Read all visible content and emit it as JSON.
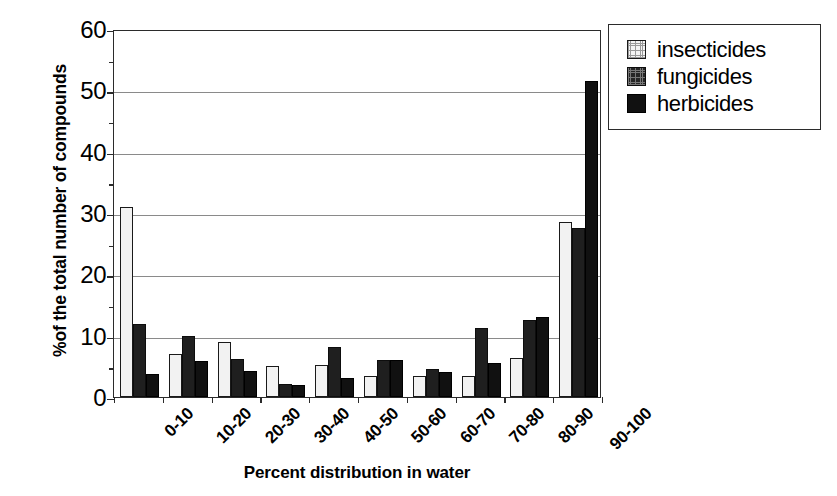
{
  "chart_data": {
    "type": "bar",
    "title": "",
    "xlabel": "Percent distribution in water",
    "ylabel": "%of the total number of compounds",
    "categories": [
      "0-10",
      "10-20",
      "20-30",
      "30-40",
      "40-50",
      "50-60",
      "60-70",
      "70-80",
      "80-90",
      "90-100"
    ],
    "series": [
      {
        "name": "insecticides",
        "swatch": "light-dotted",
        "values": [
          31,
          7,
          9,
          5,
          5.2,
          3.4,
          3.4,
          3.4,
          6.3,
          28.5
        ]
      },
      {
        "name": "fungicides",
        "swatch": "dark-textured",
        "values": [
          11.9,
          10,
          6.2,
          2.1,
          8.2,
          6,
          4.6,
          11.3,
          12.5,
          27.5
        ]
      },
      {
        "name": "herbicides",
        "swatch": "solid-black",
        "values": [
          3.8,
          5.9,
          4.3,
          2,
          3.1,
          6,
          4,
          5.5,
          13,
          51.5
        ]
      }
    ],
    "ylim": [
      0,
      60
    ],
    "ytick_values": [
      0,
      10,
      20,
      30,
      40,
      50,
      60
    ],
    "ytick_labels": [
      "0",
      "10",
      "20",
      "30",
      "40",
      "50",
      "60"
    ],
    "yminor_values": [
      5,
      15,
      25,
      35,
      45,
      55
    ],
    "grid": "horizontal",
    "legend_position": "upper-right-outside",
    "colors": {
      "axis": "#2b2b2b",
      "gridline": "#8a8a8a",
      "insecticides": "#f2f2f2",
      "fungicides": "#1f1f1f",
      "herbicides": "#111111",
      "background": "#ffffff"
    }
  },
  "legend": {
    "items": [
      {
        "label": "insecticides"
      },
      {
        "label": "fungicides"
      },
      {
        "label": "herbicides"
      }
    ]
  }
}
